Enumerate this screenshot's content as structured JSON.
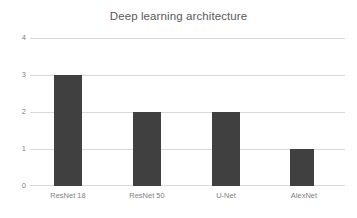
{
  "chart_data": {
    "type": "bar",
    "title": "Deep learning architecture",
    "xlabel": "",
    "ylabel": "",
    "categories": [
      "ResNet 18",
      "ResNet 50",
      "U-Net",
      "AlexNet"
    ],
    "values": [
      3,
      2,
      2,
      1
    ],
    "ylim": [
      0,
      4
    ],
    "yticks": [
      "0",
      "1",
      "2",
      "3",
      "4"
    ],
    "grid": "horizontal",
    "legend": "none",
    "colors": {
      "bar": "#404040",
      "gridline": "#d9d9d9",
      "title_text": "#595959",
      "tick_text": "#7f7f7f",
      "background": "#ffffff"
    }
  }
}
